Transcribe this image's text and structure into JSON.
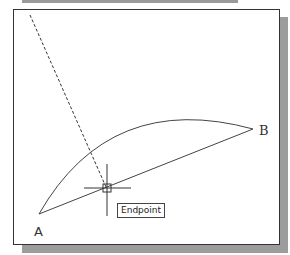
{
  "labels": {
    "point_a": "A",
    "point_b": "B"
  },
  "tooltip": {
    "text": "Endpoint"
  },
  "colors": {
    "line": "#444444",
    "frame": "#333333",
    "shadow": "#9c9c9c"
  }
}
